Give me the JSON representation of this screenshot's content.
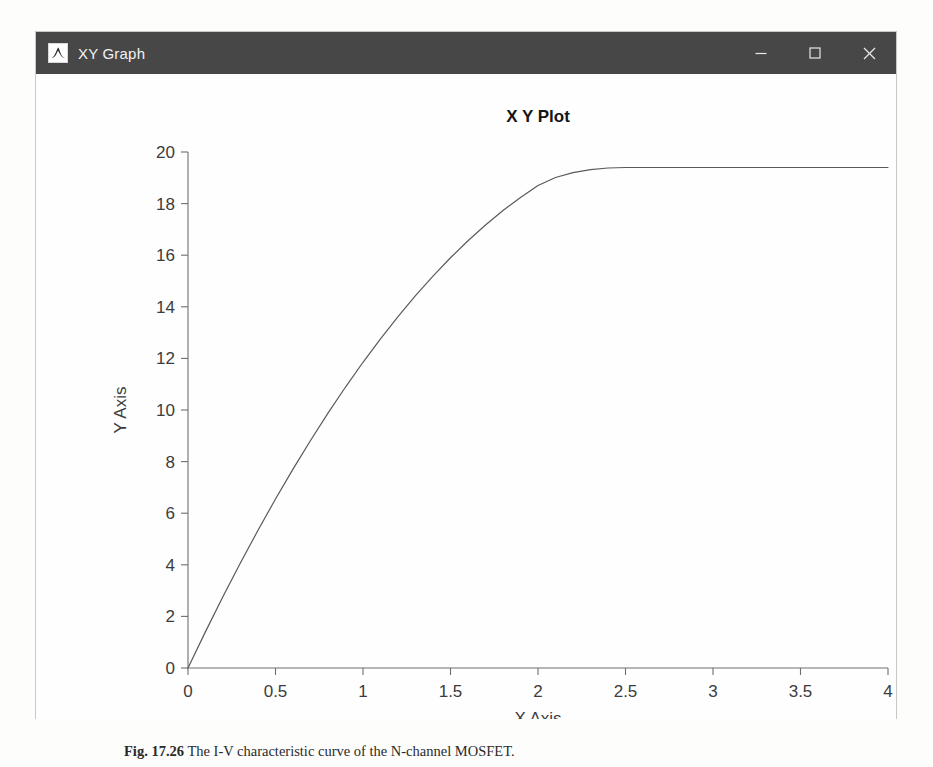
{
  "window": {
    "title": "XY Graph",
    "icon": "matlab-membrane-icon",
    "controls": [
      {
        "name": "minimize",
        "glyph": "–"
      },
      {
        "name": "maximize",
        "glyph": "□"
      },
      {
        "name": "close",
        "glyph": "✕"
      }
    ],
    "titlebar_color": "#474747",
    "titlebar_text_color": "#f2f2f2"
  },
  "caption": {
    "figure_number": "Fig. 17.26",
    "text": "The I-V characteristic curve of the N-channel MOSFET."
  },
  "chart_data": {
    "type": "line",
    "title": "X Y Plot",
    "xlabel": "X Axis",
    "ylabel": "Y Axis",
    "xlim": [
      0,
      4
    ],
    "ylim": [
      0,
      20
    ],
    "xticks": [
      0,
      0.5,
      1,
      1.5,
      2,
      2.5,
      3,
      3.5,
      4
    ],
    "xticklabels": [
      "0",
      "0.5",
      "1",
      "1.5",
      "2",
      "2.5",
      "3",
      "3.5",
      "4"
    ],
    "yticks": [
      0,
      2,
      4,
      6,
      8,
      10,
      12,
      14,
      16,
      18,
      20
    ],
    "yticklabels": [
      "0",
      "2",
      "4",
      "6",
      "8",
      "10",
      "12",
      "14",
      "16",
      "18",
      "20"
    ],
    "grid": false,
    "legend": null,
    "line_color": "#5a5a5a",
    "line_width": 1.2,
    "knee_x": 2.7,
    "saturation_y": 19.4,
    "series": [
      {
        "name": "Id vs Vds",
        "x": [
          0,
          0.1,
          0.2,
          0.3,
          0.4,
          0.5,
          0.6,
          0.7,
          0.8,
          0.9,
          1.0,
          1.1,
          1.2,
          1.3,
          1.4,
          1.5,
          1.6,
          1.7,
          1.8,
          1.9,
          2.0,
          2.1,
          2.2,
          2.3,
          2.4,
          2.5,
          2.6,
          2.7,
          2.8,
          2.9,
          3.0,
          3.1,
          3.2,
          3.3,
          3.4,
          3.5,
          3.6,
          3.7,
          3.8,
          3.9,
          4.0
        ],
        "y": [
          0,
          1.41,
          2.77,
          4.08,
          5.34,
          6.55,
          7.71,
          8.82,
          9.88,
          10.89,
          11.85,
          12.76,
          13.62,
          14.43,
          15.19,
          15.9,
          16.56,
          17.17,
          17.73,
          18.24,
          18.7,
          19.01,
          19.2,
          19.32,
          19.38,
          19.4,
          19.4,
          19.4,
          19.4,
          19.4,
          19.4,
          19.4,
          19.4,
          19.4,
          19.4,
          19.4,
          19.4,
          19.4,
          19.4,
          19.4,
          19.4
        ]
      }
    ]
  }
}
